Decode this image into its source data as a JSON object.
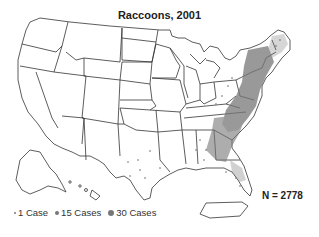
{
  "map": {
    "title": "Raccoons, 2001",
    "subject": "Reported rabies cases in raccoons, United States",
    "total_label": "N = 2778",
    "total": 2778,
    "legend": [
      {
        "label": "1 Case",
        "cases": 1,
        "dot_size": 2
      },
      {
        "label": "15 Cases",
        "cases": 15,
        "dot_size": 4
      },
      {
        "label": "30 Cases",
        "cases": 30,
        "dot_size": 6
      }
    ],
    "colors": {
      "outline": "#333333",
      "dot": "#777777",
      "dense": "#666666",
      "background": "#ffffff"
    },
    "high_density_regions": [
      "New England",
      "New York",
      "Pennsylvania",
      "New Jersey",
      "Maryland",
      "Virginia",
      "North Carolina",
      "South Carolina",
      "Georgia",
      "Florida",
      "Alabama (east)",
      "West Virginia",
      "Ohio (east)"
    ],
    "sparse_regions": [
      "Texas"
    ]
  }
}
